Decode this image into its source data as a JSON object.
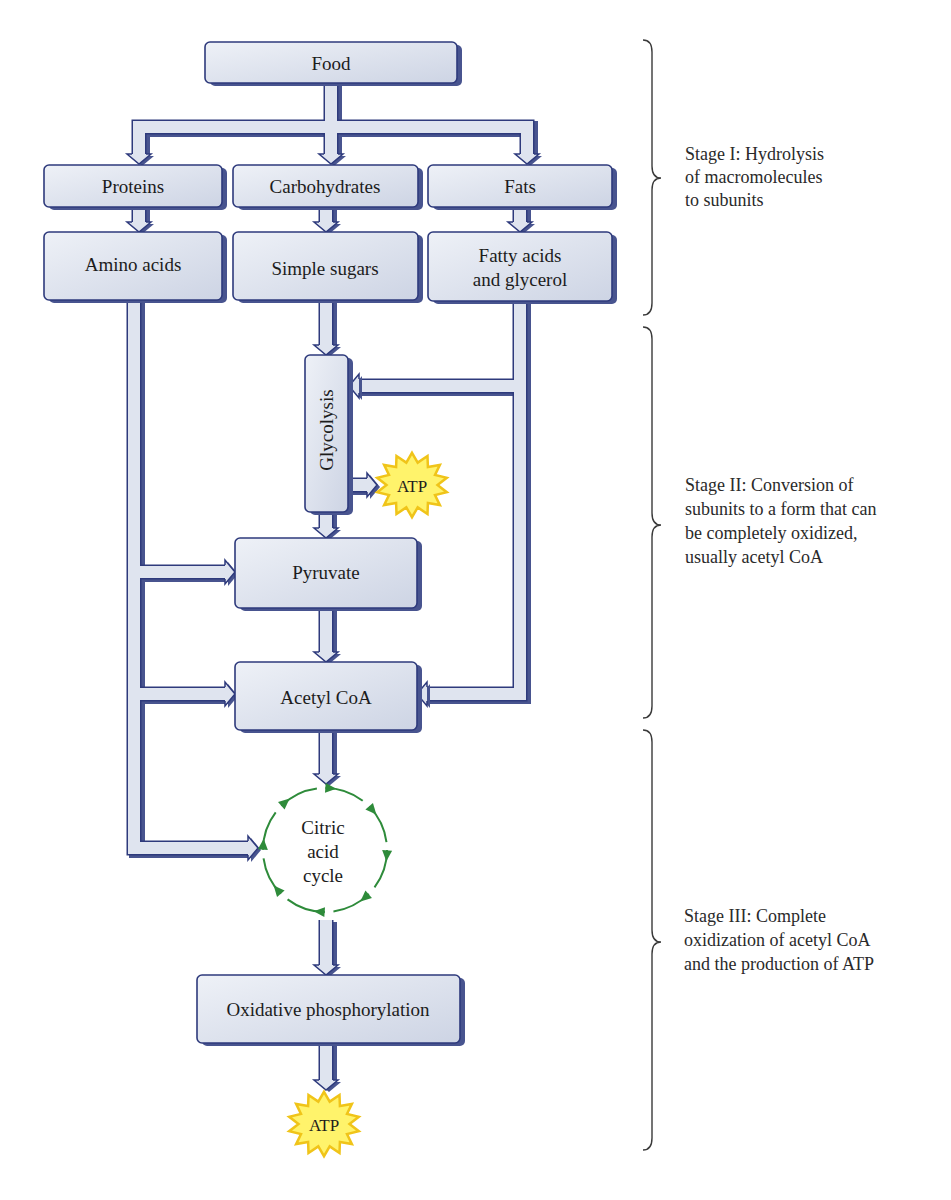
{
  "figure": {
    "nodes": {
      "food": "Food",
      "proteins": "Proteins",
      "carbohydrates": "Carbohydrates",
      "fats": "Fats",
      "amino_acids": "Amino acids",
      "simple_sugars": "Simple sugars",
      "fatty_acids": [
        "Fatty acids",
        "and glycerol"
      ],
      "glycolysis": "Glycolysis",
      "pyruvate": "Pyruvate",
      "acetyl_coa": "Acetyl CoA",
      "citric_acid_cycle": [
        "Citric",
        "acid",
        "cycle"
      ],
      "oxidative_phosphorylation": "Oxidative phosphorylation",
      "atp_glycolysis": "ATP",
      "atp_final": "ATP"
    },
    "stages": [
      {
        "lines": [
          "Stage I: Hydrolysis",
          "of macromolecules",
          "to subunits"
        ]
      },
      {
        "lines": [
          "Stage II: Conversion of",
          "subunits to a form that can",
          "be completely oxidized,",
          "usually acetyl CoA"
        ]
      },
      {
        "lines": [
          "Stage III: Complete",
          "oxidization of acetyl CoA",
          "and the production of ATP"
        ]
      }
    ]
  },
  "colors": {
    "outline": "#2e3a7c",
    "shadow": "#48548f",
    "pipe": "#dfe4ef",
    "box_light": "#eef1f7",
    "box_dark": "#cdd4e4",
    "cycle": "#2e8b3a",
    "atp_fill": "#fff36b",
    "atp_stroke": "#f0c419"
  }
}
